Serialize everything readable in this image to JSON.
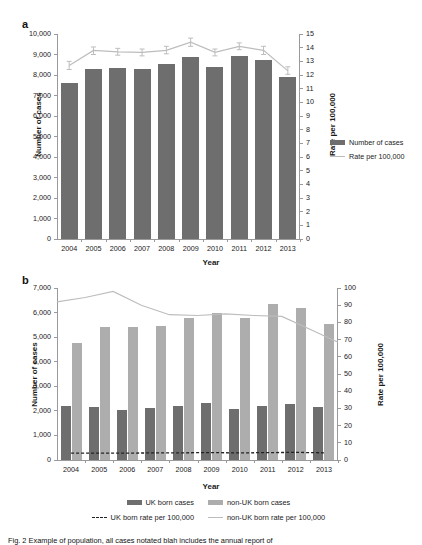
{
  "figure": {
    "panel_a_letter": "a",
    "panel_b_letter": "b",
    "caption": "Fig. 2  Example of population, all cases notated blah includes the annual report of"
  },
  "chart_data": [
    {
      "id": "panel_a",
      "type": "bar",
      "title": "",
      "xlabel": "Year",
      "ylabel": "Number of cases",
      "y2label": "Rate per 100,000",
      "categories": [
        "2004",
        "2005",
        "2006",
        "2007",
        "2008",
        "2009",
        "2010",
        "2011",
        "2012",
        "2013"
      ],
      "ylim": [
        0,
        10000
      ],
      "yticks": [
        "0",
        "1,000",
        "2,000",
        "3,000",
        "4,000",
        "5,000",
        "6,000",
        "7,000",
        "8,000",
        "9,000",
        "10,000"
      ],
      "y2lim": [
        0,
        15
      ],
      "y2ticks": [
        "0",
        "1",
        "2",
        "3",
        "4",
        "5",
        "6",
        "7",
        "8",
        "9",
        "10",
        "11",
        "12",
        "13",
        "14",
        "15"
      ],
      "grid": false,
      "legend_position": "right",
      "series": [
        {
          "name": "Number of cases",
          "kind": "bar",
          "color": "#6e6e6e",
          "axis": "left",
          "values": [
            7600,
            8290,
            8320,
            8280,
            8520,
            8900,
            8410,
            8930,
            8730,
            7920
          ]
        },
        {
          "name": "Rate per 100,000",
          "kind": "line",
          "color": "#bdbdbd",
          "axis": "right",
          "values": [
            12.7,
            13.8,
            13.7,
            13.65,
            13.8,
            14.4,
            13.65,
            14.1,
            13.8,
            12.3
          ],
          "error_low": [
            12.4,
            13.5,
            13.45,
            13.4,
            13.55,
            14.1,
            13.4,
            13.85,
            13.5,
            12.05
          ],
          "error_high": [
            13.0,
            14.05,
            13.95,
            13.9,
            14.1,
            14.7,
            13.9,
            14.35,
            14.1,
            12.6
          ]
        }
      ]
    },
    {
      "id": "panel_b",
      "type": "bar",
      "title": "",
      "xlabel": "Year",
      "ylabel": "Number of cases",
      "y2label": "Rate per 100,000",
      "categories": [
        "2004",
        "2005",
        "2006",
        "2007",
        "2008",
        "2009",
        "2010",
        "2011",
        "2012",
        "2013"
      ],
      "ylim": [
        0,
        7000
      ],
      "yticks": [
        "0",
        "1,000",
        "2,000",
        "3,000",
        "4,000",
        "5,000",
        "6,000",
        "7,000"
      ],
      "y2lim": [
        0,
        100
      ],
      "y2ticks": [
        "0",
        "10",
        "20",
        "30",
        "40",
        "50",
        "60",
        "70",
        "80",
        "90",
        "100"
      ],
      "grid": false,
      "legend_position": "bottom",
      "series": [
        {
          "name": "UK born cases",
          "kind": "bar",
          "color": "#6e6e6e",
          "axis": "left",
          "values": [
            2180,
            2150,
            2040,
            2120,
            2180,
            2310,
            2095,
            2215,
            2295,
            2140
          ]
        },
        {
          "name": "non-UK born cases",
          "kind": "bar",
          "color": "#adadad",
          "axis": "left",
          "values": [
            4770,
            5420,
            5420,
            5460,
            5760,
            5970,
            5800,
            6330,
            6190,
            5550
          ]
        },
        {
          "name": "UK born rate per 100,000",
          "kind": "dashed-line",
          "color": "#222222",
          "axis": "right",
          "values": [
            4.0,
            4.0,
            4.0,
            4.1,
            4.2,
            4.3,
            4.1,
            4.3,
            4.4,
            4.2
          ]
        },
        {
          "name": "non-UK born rate per 100,000",
          "kind": "line",
          "color": "#bdbdbd",
          "axis": "right",
          "values": [
            92.0,
            94.5,
            98.0,
            90.0,
            84.5,
            84.0,
            85.0,
            84.0,
            83.5,
            76.0,
            68.5
          ]
        }
      ]
    }
  ],
  "panel_a_legend": [
    {
      "label": "Number of cases",
      "marker": "bar",
      "color": "#6e6e6e"
    },
    {
      "label": "Rate per 100,000",
      "marker": "line",
      "color": "#bdbdbd"
    }
  ],
  "panel_b_legend": [
    {
      "label": "UK born cases",
      "marker": "bar",
      "color": "#6e6e6e"
    },
    {
      "label": "non-UK born cases",
      "marker": "bar",
      "color": "#adadad"
    },
    {
      "label": "UK born rate per 100,000",
      "marker": "dash",
      "color": "#222222"
    },
    {
      "label": "non-UK born rate per 100,000",
      "marker": "line",
      "color": "#bdbdbd"
    }
  ]
}
